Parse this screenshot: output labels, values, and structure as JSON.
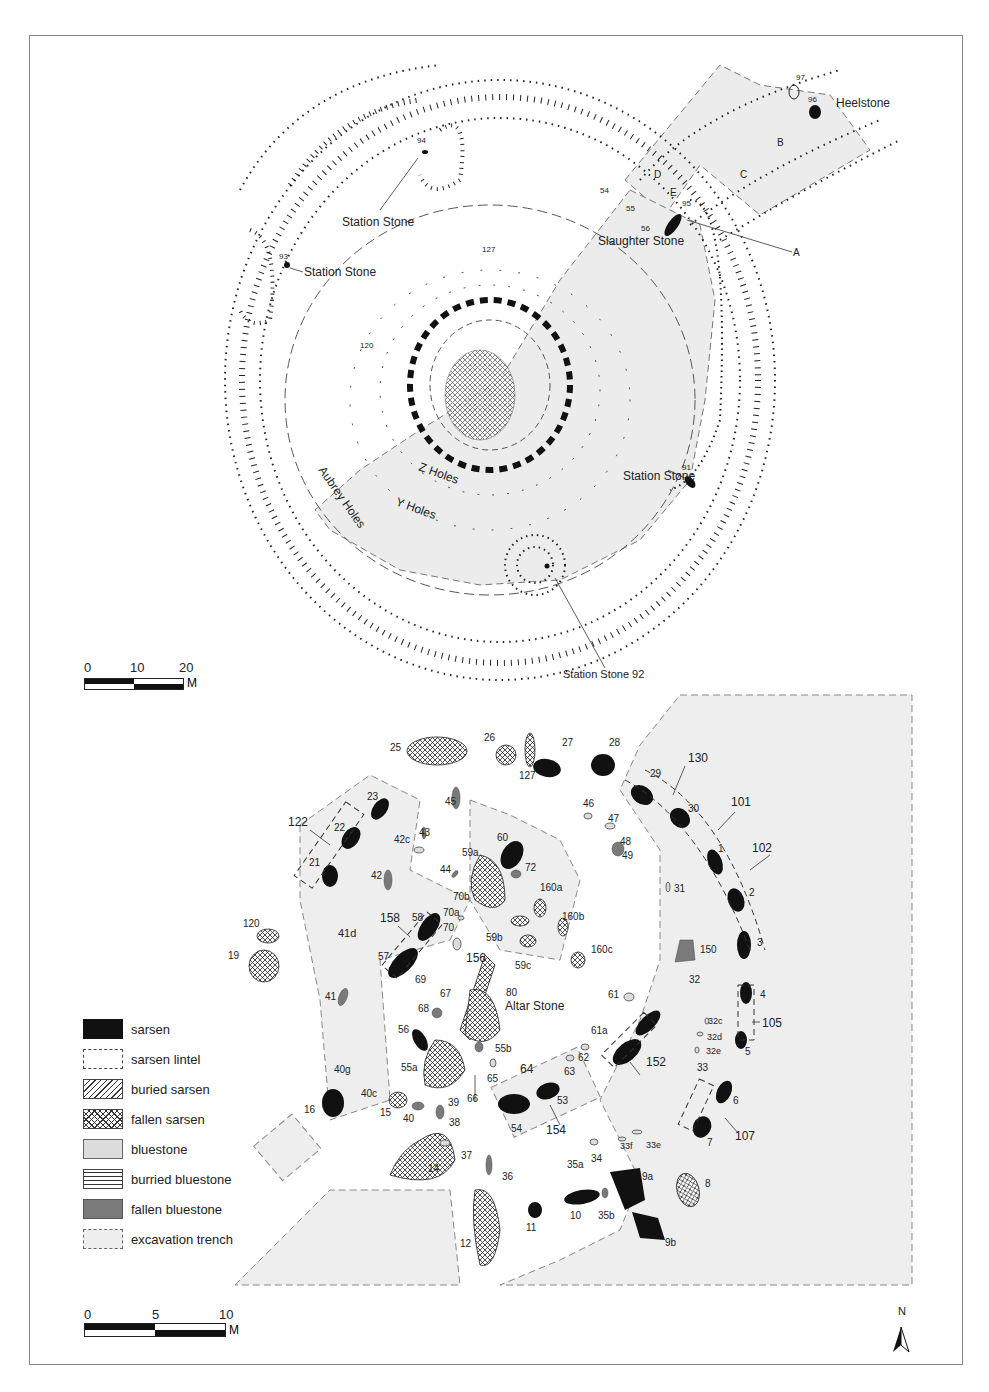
{
  "upper_plan": {
    "labels": {
      "heelstone": "Heelstone",
      "heelstone_num": "96",
      "num_97": "97",
      "station_stone_94": "Station Stone",
      "num_94": "94",
      "station_stone_93": "Station Stone",
      "num_93": "93",
      "slaughter_stone": "Slaughter Stone",
      "num_95": "95",
      "num_91": "91",
      "station_stone_91": "Station Stone",
      "station_stone_92": "Station Stone 92",
      "z_holes": "Z Holes",
      "y_holes": "Y Holes",
      "aubrey_holes": "Aubrey Holes",
      "letter_a": "A",
      "letter_b": "B",
      "letter_c": "C",
      "letter_d": "D",
      "letter_e": "E",
      "num_54": "54",
      "num_55": "55",
      "num_56": "56",
      "num_120": "120",
      "num_127": "127"
    },
    "aubrey_hole_numbers": [
      "1",
      "2",
      "3",
      "4",
      "5",
      "6",
      "7",
      "8",
      "9",
      "10",
      "11",
      "12",
      "13",
      "14",
      "15",
      "16",
      "17",
      "18",
      "19",
      "20",
      "21",
      "22",
      "23",
      "24",
      "25",
      "26",
      "27",
      "28",
      "29",
      "30",
      "31",
      "32"
    ],
    "scale": {
      "ticks": [
        "0",
        "10",
        "20"
      ],
      "unit": "M"
    }
  },
  "lower_plan": {
    "stones": {
      "sarsen_uprights": [
        "1",
        "2",
        "3",
        "4",
        "5",
        "6",
        "7",
        "9a",
        "9b",
        "10",
        "11",
        "16",
        "21",
        "22",
        "23",
        "27",
        "28",
        "29",
        "30",
        "53",
        "54",
        "56",
        "57",
        "58",
        "60"
      ],
      "lintels": [
        "101",
        "102",
        "105",
        "107",
        "122",
        "130",
        "152",
        "154",
        "158"
      ],
      "fallen_sarsens": [
        "8",
        "12",
        "14",
        "15",
        "19",
        "25",
        "26",
        "55a",
        "55b",
        "59a",
        "59b",
        "59c",
        "67",
        "120",
        "127",
        "156",
        "160a",
        "160b",
        "160c"
      ],
      "bluestones": [
        "31",
        "32c",
        "32d",
        "32e",
        "33",
        "33e",
        "33f",
        "34",
        "35a",
        "37",
        "40c",
        "40g",
        "41d",
        "42c",
        "46",
        "47",
        "49",
        "61",
        "61a",
        "62",
        "63",
        "64",
        "65",
        "69",
        "70",
        "70a",
        "70b"
      ],
      "fallen_bluestones": [
        "35b",
        "36",
        "38",
        "39",
        "40",
        "41",
        "42",
        "43",
        "44",
        "45",
        "48",
        "66",
        "68",
        "72",
        "150"
      ],
      "other_labels": [
        "32",
        "80"
      ]
    },
    "altar_stone": "Altar Stone",
    "scale": {
      "ticks": [
        "0",
        "5",
        "10"
      ],
      "unit": "M"
    },
    "north": "N"
  },
  "legend": {
    "items": [
      {
        "label": "sarsen",
        "key": "sarsen"
      },
      {
        "label": "sarsen lintel",
        "key": "lintel"
      },
      {
        "label": "buried sarsen",
        "key": "buried-sarsen"
      },
      {
        "label": "fallen sarsen",
        "key": "fallen-sarsen"
      },
      {
        "label": "bluestone",
        "key": "bluestone"
      },
      {
        "label": "burried bluestone",
        "key": "buried-bluestone"
      },
      {
        "label": "fallen bluestone",
        "key": "fallen-bluestone"
      },
      {
        "label": "excavation trench",
        "key": "trench"
      }
    ]
  },
  "colors": {
    "sarsen": "#111111",
    "bluestone": "#dcdcdc",
    "fallen_bluestone": "#7a7a7a",
    "trench_fill": "#eeeeee",
    "line": "#222222"
  }
}
